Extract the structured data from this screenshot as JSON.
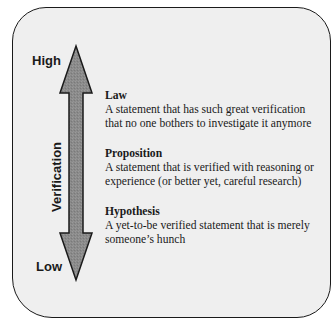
{
  "diagram": {
    "type": "vertical-scale",
    "axis": {
      "label": "Verification",
      "high_label": "High",
      "low_label": "Low"
    },
    "entries": [
      {
        "term": "Law",
        "description_lines": [
          "A statement that has such great verification",
          "that no one bothers to investigate it anymore"
        ]
      },
      {
        "term": "Proposition",
        "description_lines": [
          "A statement that is verified with reasoning or",
          "experience (or better yet, careful research)"
        ]
      },
      {
        "term": "Hypothesis",
        "description_lines": [
          "A yet-to-be verified statement that is merely",
          "someone’s hunch"
        ]
      }
    ],
    "colors": {
      "panel_background": "#efefef",
      "panel_border": "#1a1a1a",
      "arrow_fill": "#8c8c8c",
      "arrow_stroke": "#1a1a1a",
      "text": "#1a1a1a"
    }
  }
}
